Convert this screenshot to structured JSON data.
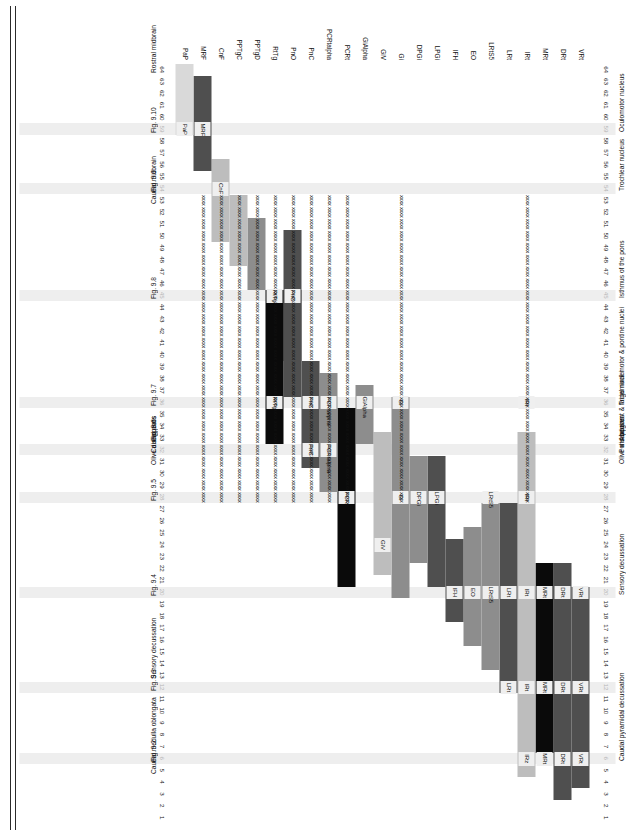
{
  "chart_data": {
    "type": "table",
    "title": "",
    "xlabel": "",
    "ylabel": "",
    "x_axis": {
      "name": "section number",
      "order": "descending",
      "min": 1,
      "max": 64,
      "ticks": [
        64,
        63,
        62,
        61,
        60,
        59,
        58,
        57,
        56,
        55,
        54,
        53,
        52,
        51,
        50,
        49,
        48,
        47,
        46,
        45,
        44,
        43,
        42,
        41,
        40,
        39,
        38,
        37,
        36,
        35,
        34,
        33,
        32,
        31,
        30,
        29,
        28,
        27,
        26,
        25,
        24,
        23,
        22,
        21,
        20,
        19,
        18,
        17,
        16,
        15,
        14,
        13,
        12,
        11,
        10,
        9,
        8,
        7,
        6,
        5,
        4,
        3,
        2,
        1
      ],
      "highlighted_sections": [
        59,
        54,
        45,
        36,
        32,
        28,
        20,
        12,
        6
      ]
    },
    "y_axis": {
      "name": "nucleus abbreviation",
      "categories": [
        "VRt",
        "DRt",
        "MRt",
        "IRt",
        "LRt",
        "LRtS5",
        "EO",
        "IFH",
        "LPGi",
        "DPGi",
        "Gi",
        "GiV",
        "GiAlpha",
        "PCRt",
        "PCRtalpha",
        "PnC",
        "PnO",
        "RtTg",
        "PPTgD",
        "PPTgC",
        "CnF",
        "MRF",
        "PaP"
      ]
    },
    "colors": {
      "black": "#0a0a0a",
      "dark_gray": "#4f4f4f",
      "mid_gray": "#8d8d8d",
      "light_gray": "#bdbdbd",
      "pale_gray": "#d9d9d9",
      "very_pale": "#e6e6e6",
      "highlight_band": "#eeeeee",
      "text": "#111111",
      "dim_text": "#b6b6b6"
    },
    "series": [
      {
        "name": "VRt",
        "start": 20,
        "end": 6,
        "shade": "dark_gray"
      },
      {
        "name": "VRt-b",
        "start": 5,
        "end": 4,
        "shade": "dark_gray"
      },
      {
        "name": "DRt",
        "start": 22,
        "end": 6,
        "shade": "dark_gray"
      },
      {
        "name": "DRt-b",
        "start": 5,
        "end": 3,
        "shade": "dark_gray"
      },
      {
        "name": "MRt",
        "start": 22,
        "end": 7,
        "shade": "black"
      },
      {
        "name": "IRt",
        "start": 33,
        "end": 6,
        "shade": "light_gray"
      },
      {
        "name": "IRt-b",
        "start": 5,
        "end": 5,
        "shade": "light_gray"
      },
      {
        "name": "LRt",
        "start": 27,
        "end": 12,
        "shade": "dark_gray"
      },
      {
        "name": "LRtS5",
        "start": 27,
        "end": 14,
        "shade": "mid_gray"
      },
      {
        "name": "EO",
        "start": 25,
        "end": 16,
        "shade": "mid_gray"
      },
      {
        "name": "IFH",
        "start": 24,
        "end": 18,
        "shade": "dark_gray"
      },
      {
        "name": "LPGi",
        "start": 31,
        "end": 21,
        "shade": "dark_gray"
      },
      {
        "name": "DPGi",
        "start": 31,
        "end": 23,
        "shade": "mid_gray"
      },
      {
        "name": "Gi",
        "start": 36,
        "end": 20,
        "shade": "mid_gray"
      },
      {
        "name": "GiV",
        "start": 33,
        "end": 22,
        "shade": "light_gray"
      },
      {
        "name": "GiAlpha",
        "start": 37,
        "end": 33,
        "shade": "mid_gray"
      },
      {
        "name": "PCRt",
        "start": 35,
        "end": 29,
        "shade": "black"
      },
      {
        "name": "PCRt-b",
        "start": 28,
        "end": 21,
        "shade": "black"
      },
      {
        "name": "PCRtalpha",
        "start": 38,
        "end": 33,
        "shade": "mid_gray"
      },
      {
        "name": "PCRtalpha-b",
        "start": 32,
        "end": 29,
        "shade": "mid_gray"
      },
      {
        "name": "PnC",
        "start": 39,
        "end": 34,
        "shade": "dark_gray"
      },
      {
        "name": "PnC-b",
        "start": 33,
        "end": 31,
        "shade": "dark_gray"
      },
      {
        "name": "PnO",
        "start": 50,
        "end": 40,
        "shade": "dark_gray"
      },
      {
        "name": "PnO-b",
        "start": 45,
        "end": 37,
        "shade": "dark_gray"
      },
      {
        "name": "RtTg",
        "start": 45,
        "end": 37,
        "shade": "black"
      },
      {
        "name": "RtTg-b",
        "start": 36,
        "end": 33,
        "shade": "black"
      },
      {
        "name": "PPTgD",
        "start": 51,
        "end": 46,
        "shade": "mid_gray"
      },
      {
        "name": "PPTgC",
        "start": 53,
        "end": 48,
        "shade": "light_gray"
      },
      {
        "name": "CnF",
        "start": 56,
        "end": 50,
        "shade": "light_gray"
      },
      {
        "name": "MRF",
        "start": 63,
        "end": 56,
        "shade": "dark_gray"
      },
      {
        "name": "PaP",
        "start": 64,
        "end": 59,
        "shade": "pale_gray"
      }
    ],
    "x_marks": {
      "label": "xxxx",
      "rows": [
        "IRt",
        "Gi",
        "PCRt",
        "PCRtalpha",
        "PnC",
        "PnO",
        "RtTg",
        "PPTgD",
        "PPTgC",
        "CnF",
        "MRF"
      ],
      "sections": [
        53,
        52,
        51,
        50,
        49,
        48,
        47,
        46,
        45,
        44,
        43,
        42,
        41,
        40,
        39,
        38,
        37,
        36,
        35,
        34,
        33,
        32,
        31,
        30,
        29,
        28
      ]
    }
  },
  "row_labels": [
    "VRt",
    "DRt",
    "MRt",
    "IRt",
    "LRt",
    "LRtS5",
    "EO",
    "IFH",
    "LPGi",
    "DPGi",
    "Gi",
    "GiV",
    "GiAlpha",
    "PCRt",
    "PCRtalpha",
    "PnC",
    "PnO",
    "RtTg",
    "PPTgD",
    "PPTgC",
    "CnF",
    "MRF",
    "PaP"
  ],
  "bar_chips": [
    {
      "label": "PaP",
      "row": "PaP",
      "section": 59
    },
    {
      "label": "MRF",
      "row": "MRF",
      "section": 59
    },
    {
      "label": "CnF",
      "row": "CnF",
      "section": 54
    },
    {
      "label": "RtTg",
      "row": "RtTg",
      "section": 45
    },
    {
      "label": "RtTg",
      "row": "RtTg",
      "section": 36
    },
    {
      "label": "PnO",
      "row": "PnO",
      "section": 45
    },
    {
      "label": "PnC",
      "row": "PnC",
      "section": 36
    },
    {
      "label": "PnC",
      "row": "PnC",
      "section": 32
    },
    {
      "label": "PCRtalpha",
      "row": "PCRtalpha",
      "section": 36
    },
    {
      "label": "PCRtalpha",
      "row": "PCRtalpha",
      "section": 32
    },
    {
      "label": "PCRt",
      "row": "PCRt",
      "section": 28
    },
    {
      "label": "GiAlpha",
      "row": "GiAlpha",
      "section": 36
    },
    {
      "label": "GiV",
      "row": "GiV",
      "section": 24
    },
    {
      "label": "Gi",
      "row": "Gi",
      "section": 36
    },
    {
      "label": "Gi",
      "row": "Gi",
      "section": 28
    },
    {
      "label": "DPGi",
      "row": "DPGi",
      "section": 28
    },
    {
      "label": "LPGi",
      "row": "LPGi",
      "section": 28
    },
    {
      "label": "IFH",
      "row": "IFH",
      "section": 20
    },
    {
      "label": "EO",
      "row": "EO",
      "section": 20
    },
    {
      "label": "LRtS5",
      "row": "LRtS5",
      "section": 28
    },
    {
      "label": "LRtS5",
      "row": "LRtS5",
      "section": 20
    },
    {
      "label": "LRt",
      "row": "LRt",
      "section": 20
    },
    {
      "label": "LRt",
      "row": "LRt",
      "section": 12
    },
    {
      "label": "IRt",
      "row": "IRt",
      "section": 36
    },
    {
      "label": "IRt",
      "row": "IRt",
      "section": 28
    },
    {
      "label": "IRt",
      "row": "IRt",
      "section": 20
    },
    {
      "label": "IRt",
      "row": "IRt",
      "section": 12
    },
    {
      "label": "IRz",
      "row": "IRt",
      "section": 6
    },
    {
      "label": "MRt",
      "row": "MRt",
      "section": 20
    },
    {
      "label": "MRt",
      "row": "MRt",
      "section": 12
    },
    {
      "label": "MRt",
      "row": "MRt",
      "section": 6
    },
    {
      "label": "DRt",
      "row": "DRt",
      "section": 20
    },
    {
      "label": "DRt",
      "row": "DRt",
      "section": 12
    },
    {
      "label": "DRt",
      "row": "DRt",
      "section": 6
    },
    {
      "label": "VRt",
      "row": "VRt",
      "section": 20
    },
    {
      "label": "VRt",
      "row": "VRt",
      "section": 12
    },
    {
      "label": "VRt",
      "row": "VRt",
      "section": 6
    }
  ],
  "event_annotations": [
    {
      "text": "Oculomotor nucleus",
      "section": 59
    },
    {
      "text": "Trochlear nucleus",
      "section": 54
    },
    {
      "text": "Isthmus of the pons",
      "section": 45
    },
    {
      "text": "Trigeminal motor & pontine nuclei",
      "section": 36
    },
    {
      "text": "Abducent & facial nuclei",
      "section": 33
    },
    {
      "text": "Pons begins",
      "section": 32
    },
    {
      "text": "Olive disappears",
      "section": 31
    },
    {
      "text": "Sensory decussation",
      "section": 20
    },
    {
      "text": "Caudal pyramidal decussation",
      "section": 6
    }
  ],
  "figure_annotations": [
    {
      "text": "Rostral midbrain",
      "section": 64
    },
    {
      "text": "Fig. 9.10",
      "section": 59
    },
    {
      "text": "Fig. 9.9",
      "section": 54
    },
    {
      "text": "Caudal midbrain",
      "section": 53
    },
    {
      "text": "Fig. 9.8",
      "section": 45
    },
    {
      "text": "Fig. 9.7",
      "section": 36
    },
    {
      "text": "Fig. 9.6",
      "section": 33
    },
    {
      "text": "Caudal pons",
      "section": 32
    },
    {
      "text": "Olive disappears",
      "section": 31
    },
    {
      "text": "Fig. 9.5",
      "section": 28
    },
    {
      "text": "Fig. 9.4",
      "section": 20
    },
    {
      "text": "Sensory decussation",
      "section": 13
    },
    {
      "text": "Fig. 9.3",
      "section": 12
    },
    {
      "text": "Fig. 9.2",
      "section": 6
    },
    {
      "text": "Caudal medulla oblongata",
      "section": 5
    }
  ]
}
